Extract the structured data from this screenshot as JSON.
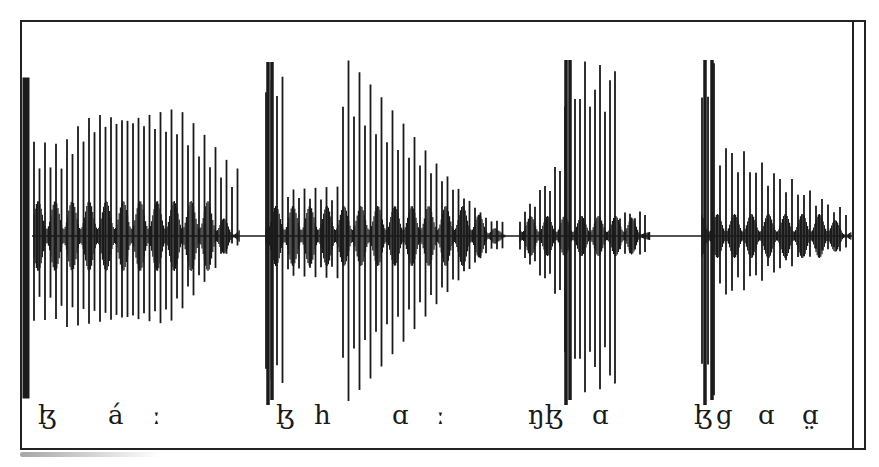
{
  "figure": {
    "type": "oscillogram",
    "colors": {
      "waveform": "#1a1a1a",
      "background": "#ffffff",
      "frame": "#222222"
    }
  },
  "segments": [
    {
      "id": "word1",
      "transcription": "ɮ á ː",
      "labels": [
        {
          "text": "ɮ",
          "x": 38
        },
        {
          "text": "á",
          "x": 108
        },
        {
          "text": "ː",
          "x": 152
        }
      ]
    },
    {
      "id": "word2",
      "transcription": "ɮ h ɑ ː",
      "labels": [
        {
          "text": "ɮ",
          "x": 276
        },
        {
          "text": "h",
          "x": 314
        },
        {
          "text": "ɑ",
          "x": 392
        },
        {
          "text": "ː",
          "x": 436
        }
      ]
    },
    {
      "id": "word3",
      "transcription": "ŋɮ ɑ",
      "labels": [
        {
          "text": "ŋɮ",
          "x": 528
        },
        {
          "text": "ɑ",
          "x": 592
        }
      ]
    },
    {
      "id": "word4",
      "transcription": "ɮ g ɑ ɑ̤",
      "labels": [
        {
          "text": "ɮ",
          "x": 694
        },
        {
          "text": "g",
          "x": 716
        },
        {
          "text": "ɑ",
          "x": 758
        },
        {
          "text": "ɑ̤",
          "x": 802
        }
      ]
    }
  ],
  "labels_flat": [
    "ɮ",
    "á",
    "ː",
    "ɮ",
    "h",
    "ɑ",
    "ː",
    "ŋɮ",
    "ɑ",
    "ɮ",
    "g",
    "ɑ",
    "ɑ̤"
  ]
}
